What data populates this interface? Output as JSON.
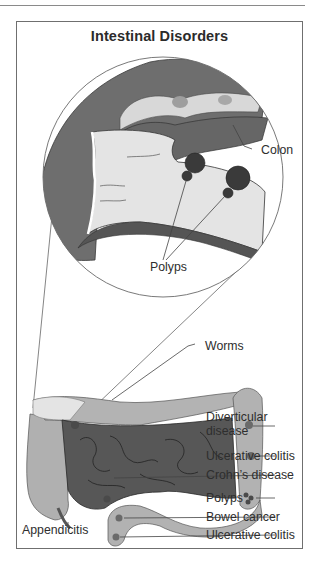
{
  "figure": {
    "title": "Intestinal Disorders",
    "magnified_view": {
      "labels": {
        "colon": "Colon",
        "polyps": "Polyps"
      }
    },
    "overview": {
      "labels": {
        "worms": "Worms",
        "diverticular_disease_line1": "Diverticular",
        "diverticular_disease_line2": "disease",
        "ulcerative_colitis_upper": "Ulcerative colitis",
        "crohns_disease": "Crohn’s disease",
        "polyps": "Polyps",
        "bowel_cancer": "Bowel cancer",
        "ulcerative_colitis_lower": "Ulcerative colitis",
        "appendicitis": "Appendicitis"
      }
    },
    "colors": {
      "colon_dark": "#6b6b6b",
      "colon_light": "#b5b5b5",
      "small_intestine": "#5a5a5a",
      "lining": "#e6e6e6",
      "lesion": "#3f3f3f",
      "line": "#555555"
    }
  }
}
